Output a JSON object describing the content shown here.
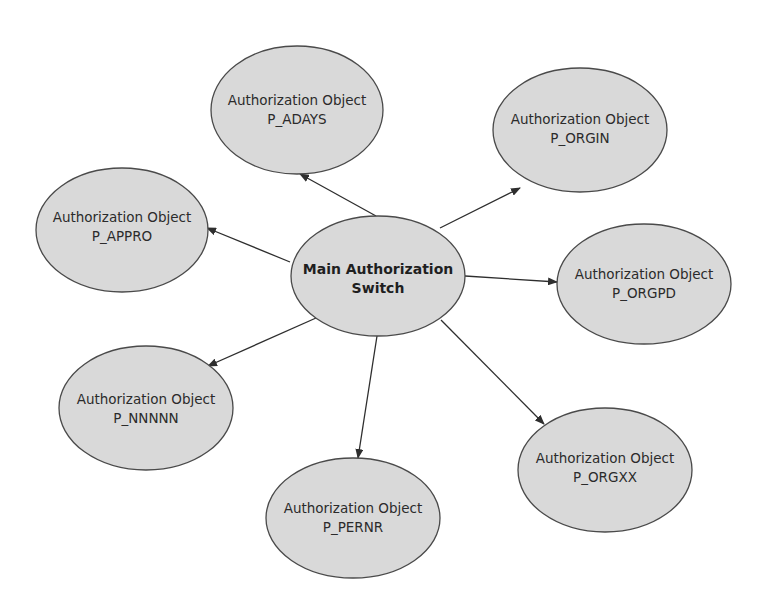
{
  "diagram": {
    "type": "hub-and-spoke",
    "colors": {
      "node_fill": "#d9d9d9",
      "node_stroke": "#4a4a4a",
      "edge": "#2e2e2e",
      "text": "#2b2b2b",
      "background": "#ffffff"
    },
    "center": {
      "line1": "Main Authorization",
      "line2": "Switch"
    },
    "nodes": [
      {
        "id": "p_adays",
        "line1": "Authorization Object",
        "line2": "P_ADAYS"
      },
      {
        "id": "p_orgin",
        "line1": "Authorization Object",
        "line2": "P_ORGIN"
      },
      {
        "id": "p_appro",
        "line1": "Authorization Object",
        "line2": "P_APPRO"
      },
      {
        "id": "p_orgpd",
        "line1": "Authorization Object",
        "line2": "P_ORGPD"
      },
      {
        "id": "p_nnnnn",
        "line1": "Authorization Object",
        "line2": "P_NNNNN"
      },
      {
        "id": "p_pernr",
        "line1": "Authorization Object",
        "line2": "P_PERNR"
      },
      {
        "id": "p_orgxx",
        "line1": "Authorization Object",
        "line2": "P_ORGXX"
      }
    ],
    "edges": [
      {
        "from": "center",
        "to": "p_adays"
      },
      {
        "from": "center",
        "to": "p_orgin"
      },
      {
        "from": "center",
        "to": "p_appro"
      },
      {
        "from": "center",
        "to": "p_orgpd"
      },
      {
        "from": "center",
        "to": "p_nnnnn"
      },
      {
        "from": "center",
        "to": "p_pernr"
      },
      {
        "from": "center",
        "to": "p_orgxx"
      }
    ]
  }
}
